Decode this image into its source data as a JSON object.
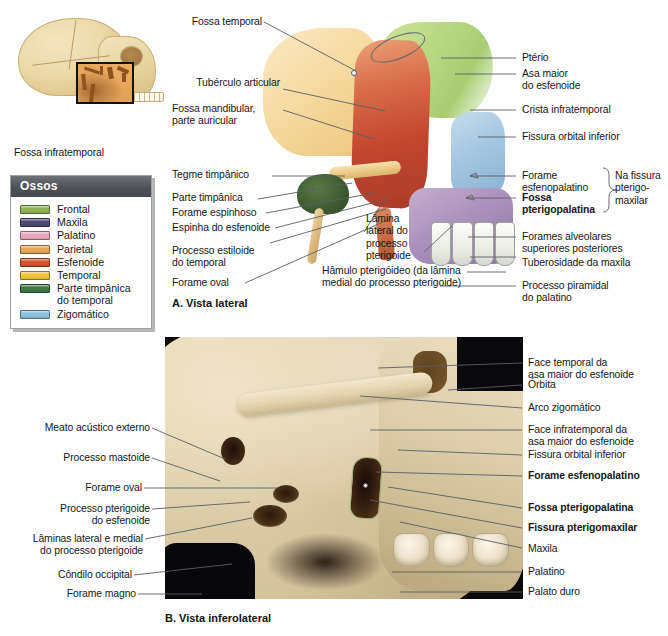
{
  "figure": {
    "title_text": "Fossa infratemporal",
    "orientation_caption": "Fossa infratemporal"
  },
  "legend": {
    "header": "Ossos",
    "items": [
      {
        "label": "Frontal",
        "color": "#8fb557"
      },
      {
        "label": "Maxila",
        "color": "#514a72"
      },
      {
        "label": "Palatino",
        "color": "#e8a7bd"
      },
      {
        "label": "Parietal",
        "color": "#e8a85c"
      },
      {
        "label": "Esfenoide",
        "color": "#d2582c"
      },
      {
        "label": "Temporal",
        "color": "#f0c53e"
      },
      {
        "label": "Parte timpânica\ndo temporal",
        "color": "#3f7b47"
      },
      {
        "label": "Zigomático",
        "color": "#8dbfe0"
      }
    ]
  },
  "panel_a": {
    "caption": "A. Vista lateral",
    "labels_left": [
      {
        "text": "Fossa temporal"
      },
      {
        "text": "Tubérculo articular"
      },
      {
        "text": "Fossa mandibular,\nparte auricular"
      },
      {
        "text": "Tegme timpânico"
      },
      {
        "text": "Parte timpânica"
      },
      {
        "text": "Forame espinhoso"
      },
      {
        "text": "Espinha do esfenoide"
      },
      {
        "text": "Processo estiloide\ndo temporal"
      },
      {
        "text": "Forame oval"
      }
    ],
    "labels_inner": [
      {
        "text": "Lâmina\nlateral do\nprocesso\npterigoide"
      },
      {
        "text": "Hâmulo pterigóideo (da lâmina\nmedial do processo pterigoide)"
      }
    ],
    "labels_right": [
      {
        "text": "Ptério",
        "bold": false
      },
      {
        "text": "Asa maior\ndo esfenoide",
        "bold": false
      },
      {
        "text": "Crista infratemporal",
        "bold": false
      },
      {
        "text": "Fissura orbital inferior",
        "bold": false
      },
      {
        "text": "Forame\nesfenopalatino",
        "bold": false
      },
      {
        "text": "Fossa\npterigopalatina",
        "bold": true
      },
      {
        "text": "Forames alveolares\nsuperiores posteriores",
        "bold": false
      },
      {
        "text": "Tuberosidade da maxila",
        "bold": false
      },
      {
        "text": "Processo piramidal\ndo palatino",
        "bold": false
      }
    ],
    "bracket_note": "Na fissura\npterigo-\nmaxilar"
  },
  "panel_b": {
    "caption": "B. Vista inferolateral",
    "labels_left": [
      {
        "text": "Meato acústico externo"
      },
      {
        "text": "Processo mastoide"
      },
      {
        "text": "Forame oval"
      },
      {
        "text": "Processo pterigoide\ndo esfenoide"
      },
      {
        "text": "Lâminas lateral e medial\ndo processo pterigoide"
      },
      {
        "text": "Côndilo occipital"
      },
      {
        "text": "Forame magno"
      }
    ],
    "labels_right": [
      {
        "text": "Face temporal da\nasa maior do esfenoide",
        "bold": false
      },
      {
        "text": "Órbita",
        "bold": false
      },
      {
        "text": "Arco zigomático",
        "bold": false
      },
      {
        "text": "Face infratemporal da\nasa maior do esfenoide",
        "bold": false
      },
      {
        "text": "Fissura orbital inferior",
        "bold": false
      },
      {
        "text": "Forame esfenopalatino",
        "bold": true
      },
      {
        "text": "Fossa pterigopalatina",
        "bold": true
      },
      {
        "text": "Fissura pterigomaxilar",
        "bold": true
      },
      {
        "text": "Maxila",
        "bold": false
      },
      {
        "text": "Palatino",
        "bold": false
      },
      {
        "text": "Palato duro",
        "bold": false
      }
    ]
  }
}
